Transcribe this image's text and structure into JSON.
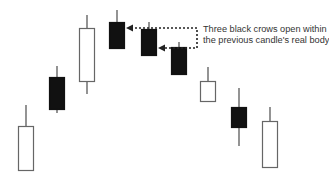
{
  "chart_data": {
    "type": "candlestick",
    "title": "",
    "xlabel": "",
    "ylabel": "",
    "grid": false,
    "legend": null,
    "note": "Values are pixel-derived relative prices (higher = up); no axis shown",
    "candles": [
      {
        "index": 1,
        "color": "white",
        "open": 56,
        "close": 12,
        "high": 77,
        "low": 12,
        "x": 26
      },
      {
        "index": 2,
        "color": "black",
        "open": 105,
        "close": 73,
        "high": 116,
        "low": 69,
        "x": 57
      },
      {
        "index": 3,
        "color": "white",
        "open": 101,
        "close": 154,
        "high": 167,
        "low": 88,
        "x": 87
      },
      {
        "index": 4,
        "color": "black",
        "open": 160,
        "close": 134,
        "high": 172,
        "low": 134,
        "x": 117
      },
      {
        "index": 5,
        "color": "black",
        "open": 153,
        "close": 127,
        "high": 160,
        "low": 127,
        "x": 149
      },
      {
        "index": 6,
        "color": "black",
        "open": 135,
        "close": 108,
        "high": 140,
        "low": 108,
        "x": 179
      },
      {
        "index": 7,
        "color": "white",
        "open": 81,
        "close": 101,
        "high": 115,
        "low": 81,
        "x": 208
      },
      {
        "index": 8,
        "color": "black",
        "open": 75,
        "close": 55,
        "high": 94,
        "low": 36,
        "x": 239
      },
      {
        "index": 9,
        "color": "white",
        "open": 15,
        "close": 61,
        "high": 75,
        "low": 15,
        "x": 270
      }
    ],
    "annotations": [
      {
        "text_lines": [
          "Three black crows open within",
          "the previous candle's real body"
        ],
        "arrows_to_candles": [
          4,
          5
        ]
      }
    ],
    "colors": {
      "bullish_fill": "#ffffff",
      "bearish_fill": "#111111",
      "outline": "#666666",
      "wick": "#666666",
      "arrow": "#222222"
    }
  },
  "annotation": {
    "line1": "Three black crows open within",
    "line2": "the previous candle's real body"
  }
}
